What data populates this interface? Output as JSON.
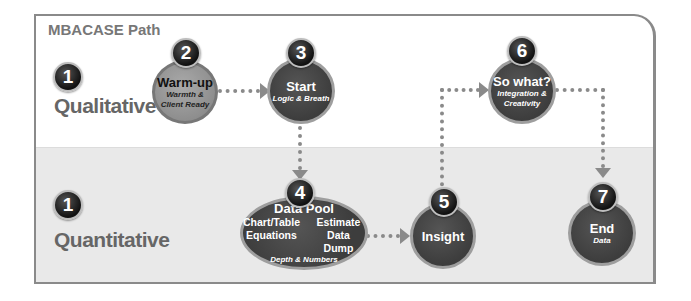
{
  "title": "MBACASE Path",
  "rows": [
    {
      "badge": "1",
      "label": "Qualitative"
    },
    {
      "badge": "1",
      "label": "Quantitative"
    }
  ],
  "nodes": [
    {
      "number": "2",
      "title": "Warm-up",
      "subtitle_line1": "Warmth &",
      "subtitle_line2": "Client Ready",
      "row": "Qualitative"
    },
    {
      "number": "3",
      "title": "Start",
      "subtitle": "Logic & Breath",
      "row": "Qualitative"
    },
    {
      "number": "4",
      "title": "Data Pool",
      "items": [
        "Chart/Table",
        "Estimate",
        "Equations",
        "Data Dump"
      ],
      "subtitle": "Depth & Numbers",
      "row": "Quantitative"
    },
    {
      "number": "5",
      "title": "Insight",
      "row": "Quantitative"
    },
    {
      "number": "6",
      "title": "So what?",
      "subtitle_line1": "Integration &",
      "subtitle_line2": "Creativity",
      "row": "Qualitative"
    },
    {
      "number": "7",
      "title": "End",
      "subtitle": "Data",
      "row": "Quantitative"
    }
  ],
  "colors": {
    "node_dark": "#3d3d3d",
    "node_light": "#999999",
    "connector": "#8a8a8a",
    "band_low": "#e9e9e9"
  }
}
